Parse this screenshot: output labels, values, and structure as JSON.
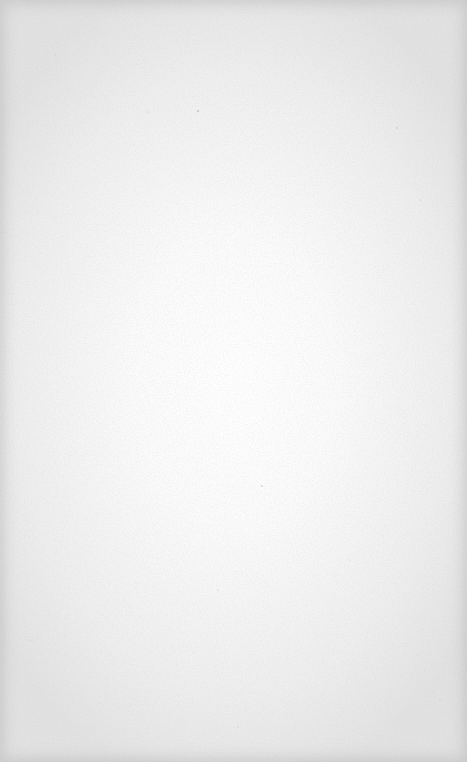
{
  "page": {
    "type": "blank-paper",
    "colors": {
      "center": "#ffffff",
      "edge": "#e2e2e2",
      "speckle": "#9a9a9a"
    }
  }
}
